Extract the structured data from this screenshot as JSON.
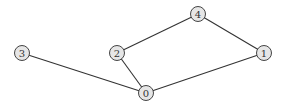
{
  "diagram": {
    "type": "undirected-graph",
    "node_radius": 7.5,
    "colors": {
      "node_fill": "#e6e6e6",
      "node_stroke": "#444444",
      "edge": "#333333",
      "label": "#333333",
      "background": "#ffffff"
    },
    "nodes": [
      {
        "id": "0",
        "label": "0",
        "x": 146,
        "y": 93
      },
      {
        "id": "1",
        "label": "1",
        "x": 264,
        "y": 53
      },
      {
        "id": "2",
        "label": "2",
        "x": 117,
        "y": 53
      },
      {
        "id": "3",
        "label": "3",
        "x": 22,
        "y": 53
      },
      {
        "id": "4",
        "label": "4",
        "x": 198,
        "y": 14
      }
    ],
    "edges": [
      {
        "source": "3",
        "target": "0"
      },
      {
        "source": "2",
        "target": "0"
      },
      {
        "source": "2",
        "target": "4"
      },
      {
        "source": "4",
        "target": "1"
      },
      {
        "source": "1",
        "target": "0"
      }
    ]
  }
}
